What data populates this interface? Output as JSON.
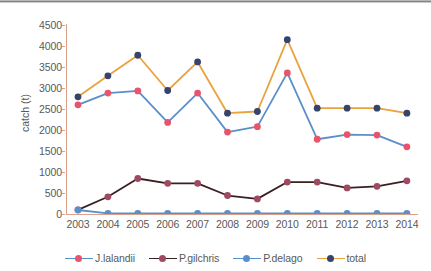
{
  "chart_data": {
    "type": "line",
    "title": "",
    "xlabel": "",
    "ylabel": "catch (t)",
    "categories": [
      "2003",
      "2004",
      "2005",
      "2006",
      "2007",
      "2008",
      "2009",
      "2010",
      "2011",
      "2012",
      "2013",
      "2014"
    ],
    "ylim": [
      0,
      4500
    ],
    "yticks": [
      0,
      500,
      1000,
      1500,
      2000,
      2500,
      3000,
      3500,
      4000,
      4500
    ],
    "grid": false,
    "legend_position": "bottom",
    "series": [
      {
        "name": "J.lalandii",
        "color": "#E8546B",
        "line_color": "#5B8FC9",
        "values": [
          2600,
          2880,
          2930,
          2180,
          2880,
          1950,
          2080,
          3360,
          1780,
          1890,
          1880,
          1600
        ]
      },
      {
        "name": "P.gilchris",
        "color": "#9E4A63",
        "line_color": "#3B2022",
        "values": [
          100,
          410,
          845,
          730,
          730,
          440,
          360,
          760,
          760,
          620,
          660,
          790
        ]
      },
      {
        "name": "P.delago",
        "color": "#5B8FC9",
        "line_color": "#5B8FC9",
        "values": [
          95,
          15,
          15,
          15,
          15,
          15,
          15,
          15,
          15,
          15,
          15,
          15
        ]
      },
      {
        "name": "total",
        "color": "#36436B",
        "line_color": "#E8A33D",
        "values": [
          2790,
          3290,
          3780,
          2940,
          3620,
          2400,
          2440,
          4150,
          2520,
          2520,
          2520,
          2400
        ]
      }
    ]
  },
  "axis": {
    "ytick_labels": [
      "4500",
      "4000",
      "3500",
      "3000",
      "2500",
      "2000",
      "1500",
      "1000",
      "500",
      "0"
    ],
    "ylabel_text": "catch (t)",
    "xtick_labels": [
      "2003",
      "2004",
      "2005",
      "2006",
      "2007",
      "2008",
      "2009",
      "2010",
      "2011",
      "2012",
      "2013",
      "2014"
    ]
  },
  "legend": {
    "items": [
      {
        "label": "J.lalandii",
        "marker_color": "#E8546B",
        "line_color": "#5B8FC9"
      },
      {
        "label": "P.gilchris",
        "marker_color": "#9E4A63",
        "line_color": "#3B2022"
      },
      {
        "label": "P.delago",
        "marker_color": "#5B8FC9",
        "line_color": "#5B8FC9"
      },
      {
        "label": "total",
        "marker_color": "#36436B",
        "line_color": "#E8A33D"
      }
    ]
  },
  "colors": {
    "axis": "#d9a08a",
    "text": "#595959",
    "background": "#ffffff",
    "top_border": "#6f6f6f"
  }
}
